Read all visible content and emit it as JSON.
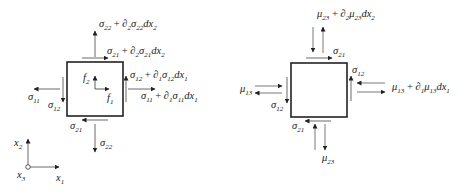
{
  "left_diagram": {
    "title": "Stress and body force on element",
    "labels": {
      "sigma22_top": {
        "base": "σ",
        "sub": "22",
        "rest": [
          " + ∂",
          "2",
          "σ",
          "22",
          "dx",
          "2"
        ]
      },
      "sigma21_top": {
        "base": "σ",
        "sub": "21",
        "rest": [
          " + ∂",
          "2",
          "σ",
          "21",
          "dx",
          "2"
        ]
      },
      "sigma12_right": {
        "base": "σ",
        "sub": "12",
        "rest": [
          " + ∂",
          "1",
          "σ",
          "12",
          "dx",
          "1"
        ]
      },
      "sigma11_right": {
        "base": "σ",
        "sub": "11",
        "rest": [
          " + ∂",
          "1",
          "σ",
          "11",
          "dx",
          "1"
        ]
      },
      "sigma11_left": {
        "base": "σ",
        "sub": "11"
      },
      "sigma12_left": {
        "base": "σ",
        "sub": "12"
      },
      "sigma21_bottom": {
        "base": "σ",
        "sub": "21"
      },
      "sigma22_bottom": {
        "base": "σ",
        "sub": "22"
      },
      "f2": {
        "base": "f",
        "sub": "2"
      },
      "f1": {
        "base": "f",
        "sub": "1"
      }
    }
  },
  "axes": {
    "x2": {
      "base": "x",
      "sub": "2"
    },
    "x1": {
      "base": "x",
      "sub": "1"
    },
    "x3": {
      "base": "x",
      "sub": "3"
    }
  },
  "right_diagram": {
    "title": "Couple stresses on element",
    "labels": {
      "mu23_top": {
        "base": "μ",
        "sub": "23",
        "rest": [
          " + ∂",
          "2",
          "μ",
          "23",
          "dx",
          "2"
        ]
      },
      "sigma21_top": {
        "base": "σ",
        "sub": "21"
      },
      "sigma12_right": {
        "base": "σ",
        "sub": "12"
      },
      "mu13_right": {
        "base": "μ",
        "sub": "13",
        "rest": [
          " + ∂",
          "1",
          "μ",
          "13",
          "dx",
          "1"
        ]
      },
      "mu13_left": {
        "base": "μ",
        "sub": "13"
      },
      "sigma12_left": {
        "base": "σ",
        "sub": "12"
      },
      "sigma21_bottom": {
        "base": "σ",
        "sub": "21"
      },
      "mu23_bottom": {
        "base": "μ",
        "sub": "23"
      }
    }
  },
  "colors": {
    "stroke": "#222222",
    "arrow_gray": "#555555"
  }
}
